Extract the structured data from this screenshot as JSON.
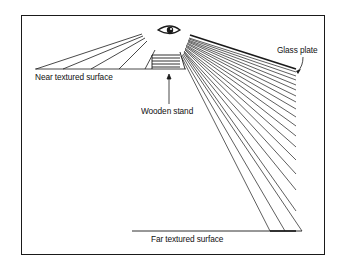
{
  "diagram": {
    "labels": {
      "near_surface": "Near textured surface",
      "far_surface": "Far textured surface",
      "wooden_stand": "Wooden stand",
      "glass_plate": "Glass plate"
    },
    "icons": {
      "eye": "eye-icon"
    },
    "colors": {
      "line": "#1a1a1a",
      "background": "#ffffff"
    }
  }
}
